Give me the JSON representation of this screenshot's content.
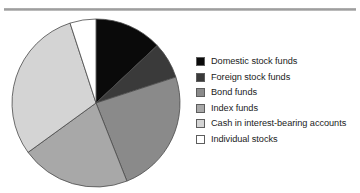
{
  "figure": {
    "width": 360,
    "height": 193,
    "background": "#ffffff",
    "top_rule_color": "#9a9a9a"
  },
  "pie": {
    "center_x": 88,
    "center_y": 87,
    "radius": 84,
    "start_angle_deg": 0,
    "direction": "clockwise",
    "outline_color": "#4a4a4a",
    "outline_width": 0.8
  },
  "legend": {
    "position": "right",
    "items": [
      {
        "label": "Domestic stock funds",
        "color": "#0a0a0a",
        "swatch_name": "swatch-domestic-stock-funds"
      },
      {
        "label": "Foreign stock funds",
        "color": "#3a3a3a",
        "swatch_name": "swatch-foreign-stock-funds"
      },
      {
        "label": "Bond funds",
        "color": "#8a8a8a",
        "swatch_name": "swatch-bond-funds"
      },
      {
        "label": "Index funds",
        "color": "#a8a8a8",
        "swatch_name": "swatch-index-funds"
      },
      {
        "label": "Cash in interest-bearing accounts",
        "color": "#d4d4d4",
        "swatch_name": "swatch-cash-interest-bearing"
      },
      {
        "label": "Individual stocks",
        "color": "#ffffff",
        "swatch_name": "swatch-individual-stocks"
      }
    ]
  },
  "chart_data": {
    "type": "pie",
    "title": "",
    "subtitle": "",
    "xlabel": "",
    "ylabel": "",
    "legend_position": "right",
    "grid": false,
    "start_angle_deg": 90,
    "counterclock": false,
    "categories": [
      "Domestic stock funds",
      "Foreign stock funds",
      "Bond funds",
      "Index funds",
      "Cash in interest-bearing accounts",
      "Individual stocks"
    ],
    "values": [
      13,
      7,
      24,
      21,
      30,
      5
    ],
    "units": "percent",
    "colors": [
      "#0a0a0a",
      "#3a3a3a",
      "#8a8a8a",
      "#a8a8a8",
      "#d4d4d4",
      "#ffffff"
    ],
    "slice_angles_deg": [
      46.8,
      25.2,
      86.4,
      75.6,
      108.0,
      18.0
    ],
    "data_labels_shown": false,
    "annotations": []
  }
}
